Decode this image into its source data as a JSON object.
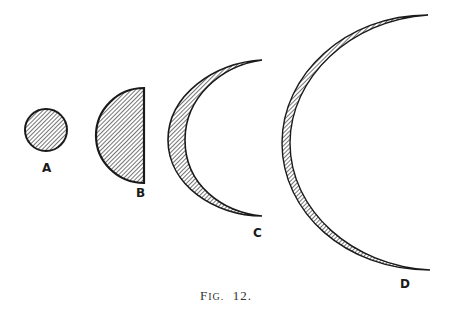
{
  "figure": {
    "caption": "Fig. 12.",
    "caption_prefix": "F",
    "caption_smallcaps": "IG.",
    "caption_number": "12.",
    "colors": {
      "ink": "#1a1a1a",
      "paper": "#ffffff"
    },
    "shapes": [
      {
        "id": "A",
        "label": "A",
        "kind": "full-disk",
        "description": "small hatched full circle"
      },
      {
        "id": "B",
        "label": "B",
        "kind": "half-disk",
        "description": "hatched half disk, flat edge on right"
      },
      {
        "id": "C",
        "label": "C",
        "kind": "crescent",
        "description": "larger hatched crescent opening right"
      },
      {
        "id": "D",
        "label": "D",
        "kind": "thin-crescent",
        "description": "largest thin hatched crescent opening right"
      }
    ]
  }
}
